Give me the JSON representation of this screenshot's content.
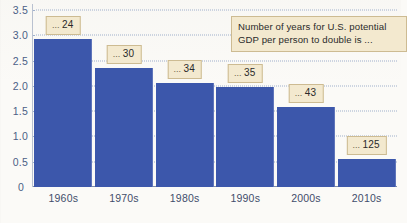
{
  "chart_data": {
    "type": "bar",
    "title": "",
    "subtitle": "",
    "xlabel": "",
    "ylabel": "",
    "categories": [
      "1960s",
      "1970s",
      "1980s",
      "1990s",
      "2000s",
      "2010s"
    ],
    "values": [
      2.93,
      2.36,
      2.05,
      1.97,
      1.58,
      0.55
    ],
    "point_labels": [
      "... 24",
      "... 30",
      "... 34",
      "... 35",
      "... 43",
      "... 125"
    ],
    "point_label_values": [
      24,
      30,
      34,
      35,
      43,
      125
    ],
    "ylim": [
      0,
      3.5
    ],
    "ytick_labels": [
      "3.5",
      "3.0",
      "2.5",
      "2.0",
      "1.5",
      "1.0",
      "0.5",
      "0"
    ],
    "ytick_values": [
      3.5,
      3.0,
      2.5,
      2.0,
      1.5,
      1.0,
      0.5,
      0
    ],
    "grid": true,
    "grid_style": "dotted-horizontal",
    "legend_position": "none",
    "annotation": "Number of years for U.S. potential GDP per person to double is ...",
    "bar_color": "#3c57ab",
    "callout_fill": "#f3e9cf",
    "callout_border": "#cdbb92",
    "grid_color": "#9fb0cc",
    "axis_text_color": "#4b5f86",
    "background": "#fbfaf7"
  }
}
